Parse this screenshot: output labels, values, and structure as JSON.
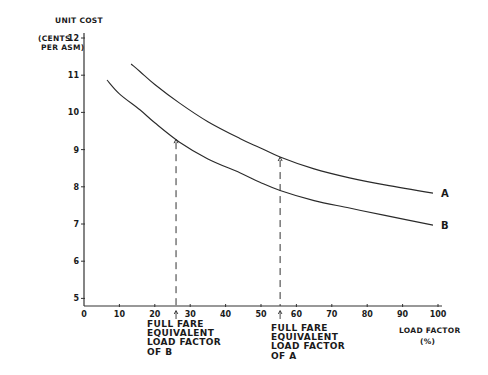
{
  "chart_data": {
    "type": "line",
    "title": "",
    "ylabel_lines": [
      "UNIT COST",
      "(CENTS",
      "PER ASM)"
    ],
    "xlabel_lines": [
      "LOAD FACTOR",
      "(%)"
    ],
    "xlim": [
      0,
      100
    ],
    "ylim": [
      5,
      12
    ],
    "x_ticks": [
      0,
      10,
      20,
      30,
      40,
      50,
      60,
      70,
      80,
      90,
      100
    ],
    "y_ticks": [
      5,
      6,
      7,
      8,
      9,
      10,
      11,
      12
    ],
    "grid": false,
    "legend": "inline labels at curve ends",
    "series": [
      {
        "name": "A",
        "x": [
          13.3,
          15.8,
          20,
          27,
          35,
          44,
          49.7,
          55.4,
          65,
          75,
          85,
          98.6
        ],
        "y": [
          11.3,
          11.1,
          10.75,
          10.25,
          9.75,
          9.3,
          9.05,
          8.8,
          8.48,
          8.24,
          8.05,
          7.83
        ]
      },
      {
        "name": "B",
        "x": [
          6.5,
          10,
          15.8,
          20,
          27,
          35,
          44,
          49.7,
          55.4,
          65,
          75,
          85,
          98.6
        ],
        "y": [
          10.87,
          10.5,
          10.07,
          9.72,
          9.2,
          8.75,
          8.38,
          8.12,
          7.9,
          7.63,
          7.43,
          7.23,
          6.97
        ]
      }
    ],
    "annotations": [
      {
        "target": "B",
        "x": 26,
        "y": 9.28,
        "style": "dashed vertical line with arrow",
        "text_lines": [
          "FULL FARE",
          "EQUIVALENT",
          "LOAD FACTOR",
          "OF B"
        ]
      },
      {
        "target": "A",
        "x": 55.4,
        "y": 8.8,
        "style": "dashed vertical line with arrow",
        "text_lines": [
          "FULL FARE",
          "EQUIVALENT",
          "LOAD FACTOR",
          "OF A"
        ]
      }
    ]
  }
}
